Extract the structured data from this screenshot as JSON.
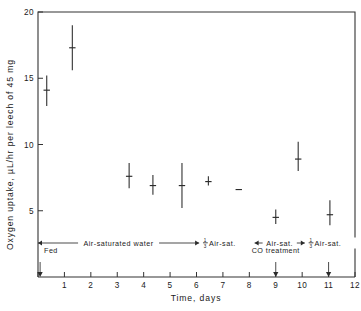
{
  "chart_data": {
    "type": "scatter",
    "title": "",
    "xlabel": "Time,   days",
    "ylabel": "Oxygen  uptake,   µL/hr per leech of 45 mg",
    "xlim": [
      0,
      12
    ],
    "ylim": [
      0,
      20
    ],
    "xticks": [
      0,
      1,
      2,
      3,
      4,
      5,
      6,
      7,
      8,
      9,
      10,
      11,
      12
    ],
    "xticklabels": [
      "",
      "1",
      "2",
      "3",
      "4",
      "5",
      "6",
      "7",
      "8",
      "9",
      "10",
      "11",
      "12"
    ],
    "yticks": [
      5,
      10,
      15,
      20
    ],
    "yticklabels": [
      "5",
      "10",
      "15",
      "20"
    ],
    "grid": false,
    "legend": null,
    "series": [
      {
        "name": "Oxygen uptake",
        "marker": "horizontal-tick-with-vertical-errorbar",
        "points": [
          {
            "x": 0.33,
            "y": 14.1,
            "ylow": 12.9,
            "yhigh": 15.2
          },
          {
            "x": 1.3,
            "y": 17.3,
            "ylow": 15.6,
            "yhigh": 19.0
          },
          {
            "x": 3.45,
            "y": 7.6,
            "ylow": 6.7,
            "yhigh": 8.6
          },
          {
            "x": 4.35,
            "y": 6.9,
            "ylow": 6.2,
            "yhigh": 7.7
          },
          {
            "x": 5.45,
            "y": 6.9,
            "ylow": 5.2,
            "yhigh": 8.6
          },
          {
            "x": 6.45,
            "y": 7.2,
            "ylow": 6.9,
            "yhigh": 7.6
          },
          {
            "x": 7.6,
            "y": 6.6,
            "ylow": 6.6,
            "yhigh": 6.6
          },
          {
            "x": 9.0,
            "y": 4.5,
            "ylow": 4.0,
            "yhigh": 5.1
          },
          {
            "x": 9.85,
            "y": 8.9,
            "ylow": 8.0,
            "yhigh": 10.2
          },
          {
            "x": 11.05,
            "y": 4.7,
            "ylow": 3.9,
            "yhigh": 5.8
          }
        ]
      }
    ],
    "condition_bars": [
      {
        "label": "Air-saturated  water",
        "x_start": 0.0,
        "x_end": 6.1,
        "fraction": ""
      },
      {
        "label": "Air-sat.",
        "x_start": 6.3,
        "x_end": 8.0,
        "fraction": "1/3"
      },
      {
        "label": "Air-sat.",
        "x_start": 8.2,
        "x_end": 10.1,
        "fraction": ""
      },
      {
        "label": "Air-sat.",
        "x_start": 10.3,
        "x_end": 12.0,
        "fraction": "1/3"
      }
    ],
    "event_markers": [
      {
        "label": "Fed",
        "x": 0.08,
        "label_dx": 4,
        "label_dy": -9
      },
      {
        "label": "CO treatment",
        "x": 9.0,
        "label_dx": 0,
        "label_dy": -9
      },
      {
        "label": "",
        "x": 11.0,
        "label_dx": 0,
        "label_dy": -9
      }
    ],
    "annotations": [
      {
        "text": "Fed"
      },
      {
        "text": "CO treatment"
      }
    ]
  },
  "figure": {
    "background_color": "#ffffff",
    "axis_color": "#333333",
    "data_color": "#2b2b2b"
  }
}
